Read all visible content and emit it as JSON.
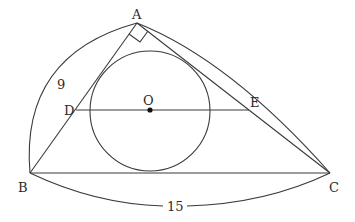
{
  "diagram": {
    "type": "geometry",
    "points": {
      "A": {
        "label": "A",
        "x": 137,
        "y": 23
      },
      "B": {
        "label": "B",
        "x": 30,
        "y": 173
      },
      "C": {
        "label": "C",
        "x": 330,
        "y": 173
      },
      "D": {
        "label": "D",
        "x": 76,
        "y": 110
      },
      "E": {
        "label": "E",
        "x": 249,
        "y": 110
      },
      "O": {
        "label": "O",
        "x": 150,
        "y": 110
      }
    },
    "circle": {
      "center": "O",
      "radius": 60
    },
    "right_angle_at": "A",
    "measurements": {
      "AB": "9",
      "BC": "15"
    },
    "colors": {
      "stroke": "#3a3a3a",
      "background": "#ffffff"
    }
  }
}
